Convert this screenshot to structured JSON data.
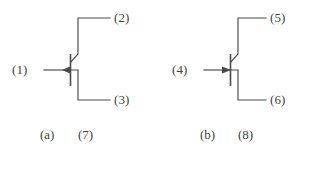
{
  "figure": {
    "background_color": "#ffffff",
    "line_color": "#4a4a4a",
    "text_color": "#3f3f3f"
  },
  "devices": [
    {
      "id": "left-transistor",
      "caption_letter": "(a)",
      "caption_number": "(7)",
      "arrow_direction": "left",
      "terminals": {
        "base": "(1)",
        "collector": "(2)",
        "emitter": "(3)"
      }
    },
    {
      "id": "right-transistor",
      "caption_letter": "(b)",
      "caption_number": "(8)",
      "arrow_direction": "right",
      "terminals": {
        "base": "(4)",
        "collector": "(5)",
        "emitter": "(6)"
      }
    }
  ]
}
